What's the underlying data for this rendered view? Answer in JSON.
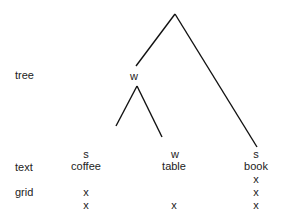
{
  "row_labels": {
    "tree": "tree",
    "text": "text",
    "grid": "grid"
  },
  "nodes": {
    "inner_w": "w",
    "coffee_stress": "s",
    "table_stress": "w",
    "book_stress": "s"
  },
  "words": [
    "coffee",
    "table",
    "book"
  ],
  "grid": {
    "coffee": [
      "x",
      "x"
    ],
    "table": [
      "x"
    ],
    "book": [
      "x",
      "x",
      "x"
    ]
  },
  "colors": {
    "line": "#111111",
    "text": "#222222"
  }
}
